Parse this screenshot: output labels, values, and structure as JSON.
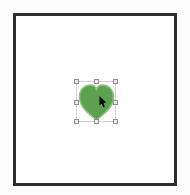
{
  "canvas": {
    "frame_border_color": "#2d2d2d",
    "background_color": "#ffffff"
  },
  "selection": {
    "handle_count": 8,
    "handle_fill": "#ededed",
    "handle_border_color": "#8c8c8c",
    "outline_color": "#cfcfcf"
  },
  "shape": {
    "type": "heart",
    "fill": "#5ca150",
    "stroke": "#92c386"
  },
  "cursor": {
    "type": "arrow-pointer",
    "color": "#000000"
  }
}
